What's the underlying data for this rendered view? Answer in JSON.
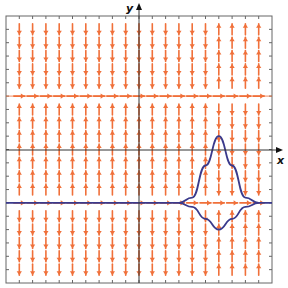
{
  "chart_data": {
    "type": "slope-field",
    "title": "",
    "xlabel": "x",
    "ylabel": "y",
    "xlim": [
      -10,
      10
    ],
    "ylim": [
      -10,
      10
    ],
    "grid": false,
    "ticks_every": 1,
    "field": {
      "description": "Direction field with equilibrium solutions y = 4 and y = -4; slope sign changes near x ≈ 5.5",
      "columns_x": [
        -9,
        -8,
        -7,
        -6,
        -5,
        -4,
        -3,
        -2,
        -1,
        0,
        1,
        2,
        3,
        4,
        5,
        6,
        7,
        8,
        9
      ],
      "rows_y": [
        9,
        8,
        7,
        6,
        5,
        4,
        3,
        2,
        1,
        0,
        -1,
        -2,
        -3,
        -4,
        -5,
        -6,
        -7,
        -8,
        -9
      ],
      "equilibria_y": [
        4,
        -4
      ],
      "sign_change_x": 5.5
    },
    "series": [
      {
        "name": "equilibrium y = -4 with upper solution",
        "color": "#3a3a8c",
        "points": [
          [
            -10,
            -4
          ],
          [
            3,
            -4
          ],
          [
            4,
            -3.6
          ],
          [
            5,
            -1.2
          ],
          [
            6,
            1.0
          ],
          [
            7,
            -1.2
          ],
          [
            8,
            -3.6
          ],
          [
            9,
            -4
          ],
          [
            10,
            -4
          ]
        ]
      },
      {
        "name": "lower solution",
        "color": "#3a3a8c",
        "points": [
          [
            3,
            -4
          ],
          [
            4,
            -4.3
          ],
          [
            5,
            -5.2
          ],
          [
            6,
            -6.0
          ],
          [
            7,
            -5.2
          ],
          [
            8,
            -4.3
          ],
          [
            9,
            -4
          ]
        ]
      }
    ],
    "colors": {
      "arrows": "#f0703a",
      "curves": "#3a3a8c",
      "axes": "#333333"
    }
  }
}
